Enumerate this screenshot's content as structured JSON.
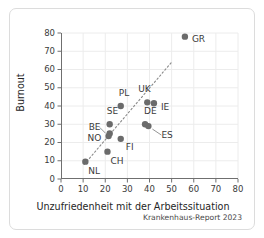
{
  "chart_data": {
    "type": "scatter",
    "title": "",
    "xlabel": "Unzufriedenheit mit der Arbeitssituation",
    "ylabel": "Burnout",
    "xlim": [
      0,
      80
    ],
    "ylim": [
      0,
      80
    ],
    "xticks": [
      0,
      10,
      20,
      30,
      40,
      50,
      60,
      70,
      80
    ],
    "yticks": [
      0,
      10,
      20,
      30,
      40,
      50,
      60,
      70,
      80
    ],
    "grid": true,
    "legend": "none",
    "points": [
      {
        "label": "GR",
        "x": 56,
        "y": 78,
        "label_dx": 7,
        "label_dy": 3,
        "leader": false
      },
      {
        "label": "IE",
        "x": 42,
        "y": 41.5,
        "label_dx": 7,
        "label_dy": 5,
        "leader": false
      },
      {
        "label": "UK",
        "x": 39,
        "y": 42,
        "label_dx": -9,
        "label_dy": -12,
        "leader": false
      },
      {
        "label": "PL",
        "x": 27,
        "y": 40,
        "label_dx": -2,
        "label_dy": -12,
        "leader": false
      },
      {
        "label": "DE",
        "x": 38,
        "y": 30,
        "label_dx": -1,
        "label_dy": -12,
        "leader": false
      },
      {
        "label": "ES",
        "x": 39.5,
        "y": 29,
        "label_dx": 13,
        "label_dy": 10,
        "leader": true
      },
      {
        "label": "SE",
        "x": 22,
        "y": 30,
        "label_dx": -3,
        "label_dy": -12,
        "leader": false
      },
      {
        "label": "BE",
        "x": 22,
        "y": 25,
        "label_dx": -21,
        "label_dy": -5,
        "leader": true
      },
      {
        "label": "NO",
        "x": 21.5,
        "y": 23.5,
        "label_dx": -21,
        "label_dy": 3,
        "leader": false
      },
      {
        "label": "FI",
        "x": 27,
        "y": 22,
        "label_dx": 5,
        "label_dy": 9,
        "leader": false
      },
      {
        "label": "CH",
        "x": 21,
        "y": 15,
        "label_dx": 3,
        "label_dy": 10,
        "leader": false
      },
      {
        "label": "NL",
        "x": 11,
        "y": 9.5,
        "label_dx": 3,
        "label_dy": 10,
        "leader": false
      }
    ],
    "trendline": {
      "x0": 10.5,
      "y0": 8,
      "x1": 50,
      "y1": 64,
      "style": "dotted"
    },
    "point_color": "#6b6b6b",
    "trend_color": "#8a8a8a"
  },
  "footer": {
    "source": "Krankenhaus-Report 2023"
  }
}
